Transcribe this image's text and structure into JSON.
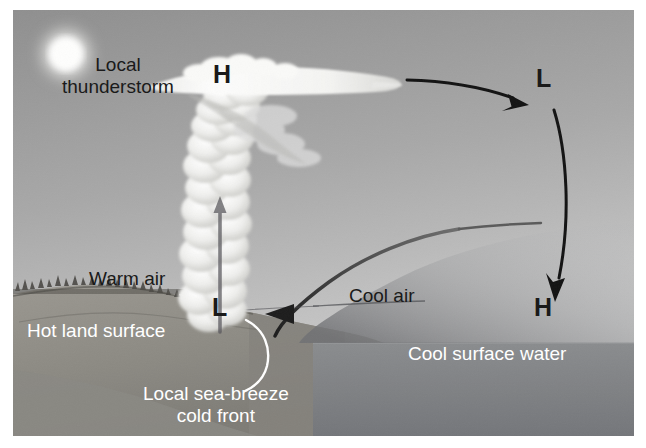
{
  "figure": {
    "width": 621,
    "height": 426
  },
  "labels": {
    "local_thunderstorm": "Local\nthunderstorm",
    "warm_air": "Warm air",
    "hot_land_surface": "Hot land surface",
    "cool_air": "Cool air",
    "cool_surface_water": "Cool surface water",
    "cold_front": "Local sea-breeze\ncold front"
  },
  "pressure_markers": {
    "anvil_high": "H",
    "upper_low": "L",
    "surface_low": "L",
    "sea_high": "H"
  },
  "colors": {
    "sky_top": "#9a9a9a",
    "sky_bottom": "#c9c9c9",
    "land": "#8e8c86",
    "water": "#7c7e80",
    "cloud": "#f2f2f0",
    "ink": "#111111",
    "label_light": "#ffffff",
    "sun": "#fdfdfb"
  },
  "icons": {
    "sun": "sun-icon",
    "updraft": "updraft-arrow-icon",
    "outflow": "outflow-arrow-icon",
    "subsidence": "subsidence-arrow-icon",
    "sea_breeze": "sea-breeze-arrow-icon",
    "front_leader": "front-leader-line-icon"
  }
}
